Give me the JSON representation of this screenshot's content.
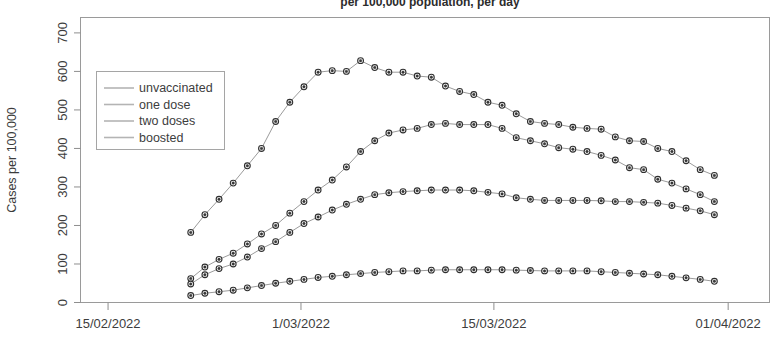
{
  "chart_data": {
    "type": "line",
    "title": "per 100,000 population, per day",
    "xlabel": "",
    "ylabel": "Cases per 100,000",
    "ylim": [
      0,
      740
    ],
    "yticks": [
      0,
      100,
      200,
      300,
      400,
      500,
      600,
      700
    ],
    "ytick_labels": [
      "0",
      "100",
      "200",
      "300",
      "400",
      "500",
      "600",
      "700"
    ],
    "xticks": [
      "15/02/2022",
      "1/03/2022",
      "15/03/2022",
      "01/04/2022"
    ],
    "xtick_positions_days": [
      0,
      14,
      28,
      45
    ],
    "x_domain_days": [
      -2,
      48
    ],
    "grid": false,
    "legend_position": "upper left",
    "legend_entries": [
      "unvaccinated",
      "one dose",
      "two doses",
      "boosted"
    ],
    "x": [
      "21/02/2022",
      "22/02/2022",
      "23/02/2022",
      "24/02/2022",
      "25/02/2022",
      "26/02/2022",
      "27/02/2022",
      "28/02/2022",
      "01/03/2022",
      "02/03/2022",
      "03/03/2022",
      "04/03/2022",
      "05/03/2022",
      "06/03/2022",
      "07/03/2022",
      "08/03/2022",
      "09/03/2022",
      "10/03/2022",
      "11/03/2022",
      "12/03/2022",
      "13/03/2022",
      "14/03/2022",
      "15/03/2022",
      "16/03/2022",
      "17/03/2022",
      "18/03/2022",
      "19/03/2022",
      "20/03/2022",
      "21/03/2022",
      "22/03/2022",
      "23/03/2022",
      "24/03/2022",
      "25/03/2022",
      "26/03/2022",
      "27/03/2022",
      "28/03/2022",
      "29/03/2022",
      "30/03/2022"
    ],
    "series": [
      {
        "name": "unvaccinated",
        "values": [
          182,
          228,
          268,
          310,
          355,
          400,
          470,
          520,
          560,
          598,
          602,
          600,
          628,
          610,
          598,
          598,
          588,
          585,
          562,
          548,
          540,
          520,
          512,
          490,
          470,
          465,
          462,
          455,
          452,
          450,
          430,
          420,
          418,
          400,
          392,
          368,
          345,
          330
        ]
      },
      {
        "name": "one dose",
        "values": [
          62,
          92,
          112,
          128,
          152,
          178,
          200,
          232,
          262,
          292,
          318,
          352,
          392,
          420,
          440,
          448,
          452,
          462,
          465,
          462,
          462,
          462,
          452,
          428,
          420,
          412,
          402,
          398,
          392,
          382,
          370,
          350,
          345,
          320,
          310,
          295,
          280,
          262
        ]
      },
      {
        "name": "two doses",
        "values": [
          48,
          72,
          88,
          100,
          118,
          140,
          158,
          182,
          205,
          222,
          240,
          255,
          268,
          280,
          285,
          288,
          290,
          292,
          292,
          292,
          290,
          286,
          282,
          272,
          268,
          265,
          265,
          265,
          265,
          264,
          262,
          262,
          260,
          258,
          252,
          245,
          238,
          228
        ]
      },
      {
        "name": "boosted",
        "values": [
          18,
          24,
          28,
          32,
          38,
          44,
          50,
          55,
          60,
          65,
          68,
          72,
          75,
          78,
          80,
          82,
          82,
          84,
          85,
          85,
          85,
          85,
          85,
          84,
          83,
          82,
          82,
          82,
          82,
          80,
          78,
          76,
          74,
          72,
          68,
          64,
          60,
          55
        ]
      }
    ]
  }
}
